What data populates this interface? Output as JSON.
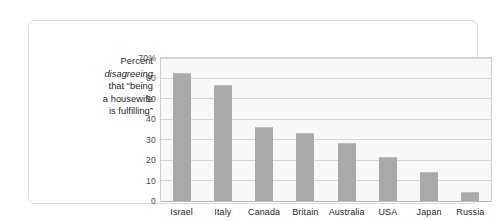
{
  "caption": {
    "line1": "Percent",
    "line2_italic": "disagreeing",
    "line3": "that “being",
    "line4": "a housewife",
    "line5": "is fulfilling”"
  },
  "colors": {
    "bar": "#a9a9a9",
    "plot_background": "#f8f8f8",
    "gridline": "#d6d6d6",
    "plot_border": "#cfcfcf",
    "card_border": "#d9d9d9",
    "text": "#231f20",
    "tick_text": "#4a4a4a"
  },
  "chart_data": {
    "type": "bar",
    "title": "",
    "subtitle": "",
    "xlabel": "",
    "ylabel": "Percent disagreeing that “being a housewife is fulfilling”",
    "categories": [
      "Israel",
      "Italy",
      "Canada",
      "Britain",
      "Australia",
      "USA",
      "Japan",
      "Russia"
    ],
    "values": [
      62.5,
      57,
      36,
      33.5,
      28.5,
      21.5,
      14,
      4.5
    ],
    "ylim": [
      0,
      70
    ],
    "ytick_values": [
      0,
      10,
      20,
      30,
      40,
      50,
      60,
      70
    ],
    "ytick_labels": [
      "0",
      "10",
      "20",
      "30",
      "40",
      "50",
      "60",
      "70%"
    ],
    "grid": "horizontal",
    "legend": "none",
    "bar_color": "#a9a9a9",
    "annotations": []
  }
}
